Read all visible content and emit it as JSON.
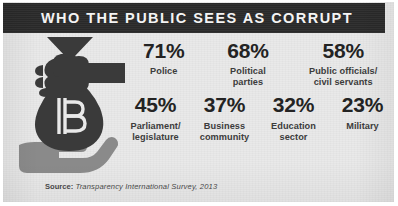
{
  "header": {
    "title": "WHO THE PUBLIC SEES AS CORRUPT"
  },
  "illustration": {
    "name": "bribery-money-bag-handoff",
    "currency_symbol": "฿",
    "giving_hand_color": "#3a3a3a",
    "receiving_hand_color": "#8a8a8a",
    "bag_color": "#3a3a3a"
  },
  "colors": {
    "header_background": "#2b2b2b",
    "header_text": "#f4f4f4",
    "panel_background": "#e9e9e9",
    "value_text": "#232323",
    "label_text": "#3c3c3c",
    "source_text": "#4a4a4a"
  },
  "chart_data": {
    "type": "bar",
    "title": "WHO THE PUBLIC SEES AS CORRUPT",
    "xlabel": "",
    "ylabel": "Percent seen as corrupt",
    "ylim": [
      0,
      100
    ],
    "categories": [
      "Police",
      "Political parties",
      "Public officials/ civil servants",
      "Parliament/ legislature",
      "Business community",
      "Education sector",
      "Military"
    ],
    "values": [
      71,
      68,
      58,
      45,
      37,
      32,
      23
    ],
    "value_labels": [
      "71%",
      "68%",
      "58%",
      "45%",
      "37%",
      "32%",
      "23%"
    ],
    "grid": false,
    "legend": "none",
    "source": "Transparency International Survey, 2013"
  },
  "stats": {
    "row1": [
      {
        "value": "71%",
        "label": "Police"
      },
      {
        "value": "68%",
        "label": "Political\nparties"
      },
      {
        "value": "58%",
        "label": "Public officials/\ncivil servants"
      }
    ],
    "row2": [
      {
        "value": "45%",
        "label": "Parliament/\nlegislature"
      },
      {
        "value": "37%",
        "label": "Business\ncommunity"
      },
      {
        "value": "32%",
        "label": "Education\nsector"
      },
      {
        "value": "23%",
        "label": "Military"
      }
    ]
  },
  "source": {
    "label": "Source:",
    "text": "Transparency International Survey, 2013"
  }
}
